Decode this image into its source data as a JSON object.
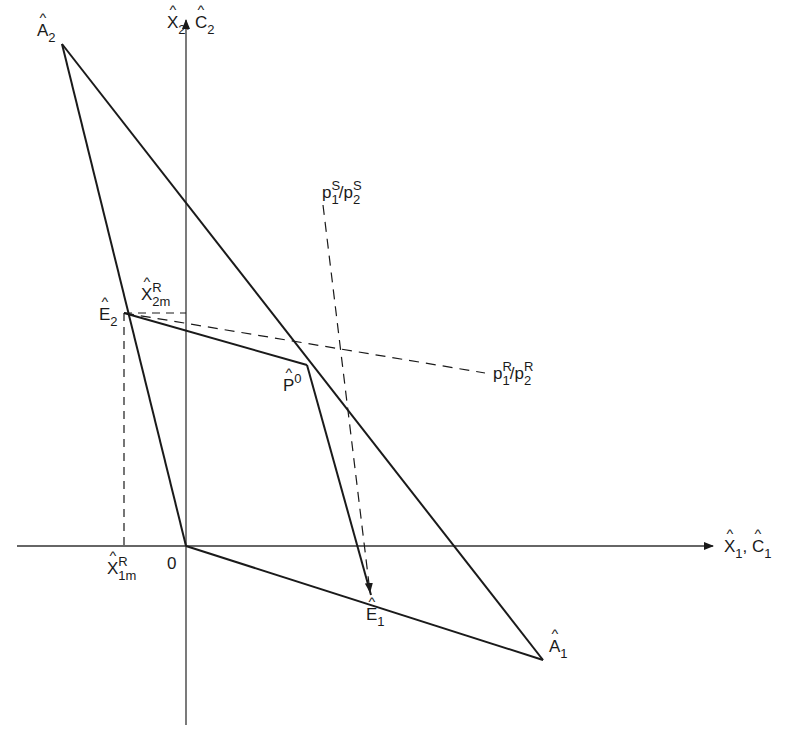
{
  "diagram": {
    "title": "",
    "axes": {
      "x_label": {
        "main": "X",
        "sub": "1",
        "second": "C",
        "second_sub": "1"
      },
      "y_label": {
        "main": "X",
        "sub": "2",
        "second": "C",
        "second_sub": "2"
      },
      "origin_label": "0"
    },
    "points": {
      "A2": {
        "letter": "A",
        "sub": "2"
      },
      "A1": {
        "letter": "A",
        "sub": "1"
      },
      "E2": {
        "letter": "E",
        "sub": "2"
      },
      "E1": {
        "letter": "E",
        "sub": "1"
      },
      "P0": {
        "letter": "P",
        "sup": "0"
      }
    },
    "annotations": {
      "x2m": {
        "letter": "X",
        "sup": "R",
        "sub": "2m"
      },
      "x1m": {
        "letter": "X",
        "sup": "R",
        "sub": "1m"
      },
      "price_s": {
        "p1": "p",
        "sub1": "1",
        "sup1": "S",
        "slash": "/",
        "p2": "p",
        "sub2": "2",
        "sup2": "S"
      },
      "price_r": {
        "p1": "p",
        "sub1": "1",
        "sup1": "R",
        "slash": "/",
        "p2": "p",
        "sub2": "2",
        "sup2": "R"
      }
    },
    "colors": {
      "line": "#1a1a1a",
      "axis": "#333333",
      "background": "#ffffff"
    }
  }
}
